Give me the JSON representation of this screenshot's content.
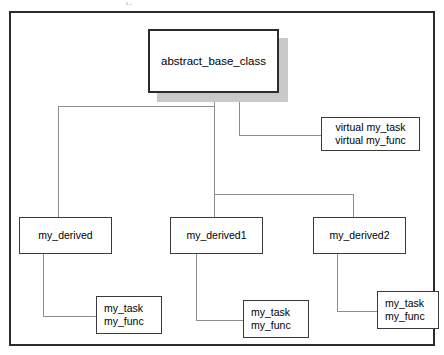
{
  "diagram": {
    "nodes": {
      "base": {
        "label": "abstract_base_class"
      },
      "virtual_methods": {
        "line1": "virtual my_task",
        "line2": "virtual my_func"
      },
      "derived": {
        "label": "my_derived"
      },
      "derived1": {
        "label": "my_derived1"
      },
      "derived2": {
        "label": "my_derived2"
      },
      "methods_derived": {
        "line1": "my_task",
        "line2": "my_func"
      },
      "methods_derived1": {
        "line1": "my_task",
        "line2": "my_func"
      },
      "methods_derived2": {
        "line1": "my_task",
        "line2": "my_func"
      }
    },
    "colors": {
      "frame_border": "#2b2b2b",
      "node_border": "#3a3a3a",
      "connector": "#8d8d8d",
      "shadow": "#c9c9c9",
      "background": "#ffffff",
      "text": "#000000"
    }
  }
}
